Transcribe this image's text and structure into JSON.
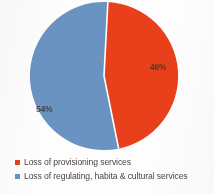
{
  "chart_data": {
    "type": "pie",
    "title": "",
    "subtitle": "",
    "xlabel": "",
    "ylabel": "",
    "grid": false,
    "legend_position": "bottom",
    "labels_shown_on_slices": true,
    "start_angle_deg": 3,
    "categories": [
      "Loss of provisioning services",
      "Loss of regulating, habita & cultural services"
    ],
    "values": [
      46,
      54
    ],
    "value_labels": [
      "46%",
      "54%"
    ],
    "colors": [
      "#e8401a",
      "#6b93c2"
    ],
    "slices": [
      {
        "name": "Loss of provisioning services",
        "value": 46,
        "label": "46%",
        "color": "#e8401a"
      },
      {
        "name": "Loss of regulating, habita & cultural services",
        "value": 54,
        "label": "54%",
        "color": "#6b93c2"
      }
    ]
  },
  "legend": {
    "items": [
      {
        "label": "Loss of provisioning services",
        "color": "#e8401a",
        "marker": "square-marker-red"
      },
      {
        "label": "Loss of regulating, habita & cultural services",
        "color": "#6b93c2",
        "marker": "square-marker-blue"
      }
    ]
  },
  "colors": {
    "red": "#e8401a",
    "blue": "#6b93c2",
    "background": "#fefdfd",
    "label_text": "#3a3330",
    "legend_text": "#4a4440",
    "slice_divider": "#ffffff"
  }
}
